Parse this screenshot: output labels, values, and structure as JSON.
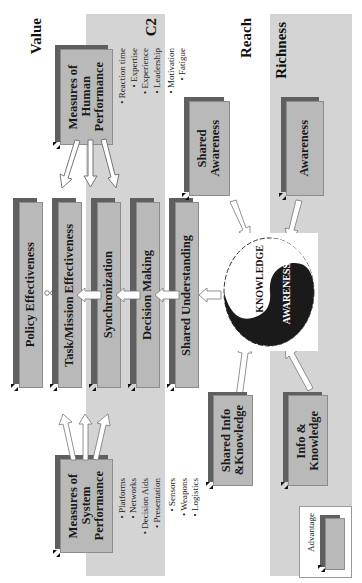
{
  "axis_labels": {
    "value": "Value",
    "reach": "Reach",
    "richness": "Richness",
    "c2": "C2"
  },
  "boxes": {
    "human_performance": {
      "lines": [
        "Measures of",
        "Human",
        "Performance"
      ]
    },
    "system_performance": {
      "lines": [
        "Measures of",
        "System",
        "Performance"
      ]
    },
    "policy_effectiveness": {
      "label": "Policy Effectiveness"
    },
    "task_mission_effectiveness": {
      "label": "Task/Mission Effectiveness"
    },
    "synchronization": {
      "label": "Synchronization"
    },
    "decision_making": {
      "label": "Decision Making"
    },
    "shared_understanding": {
      "label": "Shared Understanding"
    },
    "shared_awareness": {
      "lines": [
        "Shared",
        "Awareness"
      ]
    },
    "awareness": {
      "label": "Awareness"
    },
    "shared_info_knowledge": {
      "lines": [
        "Shared Info",
        "&Knowledge"
      ]
    },
    "info_knowledge": {
      "lines": [
        "Info &",
        "Knowledge"
      ]
    }
  },
  "human_performance_factors": [
    "• Reaction time",
    "• Expertise",
    "• Experience",
    "• Leadership",
    "• Motivation",
    "• Fatigue"
  ],
  "system_performance_factors": [
    "• Platforms",
    "• Networks",
    "• Decision Aids",
    "• Presentation",
    "• Sensors",
    "• Weapons",
    "• Logistics"
  ],
  "yin_yang": {
    "top_label": "KNOWLEDGE",
    "bottom_label": "AWARENESS"
  },
  "legend": {
    "label": "Advantage"
  },
  "colors": {
    "band": "#d4d4d4",
    "box_face": "#b9b9b9",
    "box_shadow": "#5f5f5f",
    "yin": "#1a1a1a"
  }
}
